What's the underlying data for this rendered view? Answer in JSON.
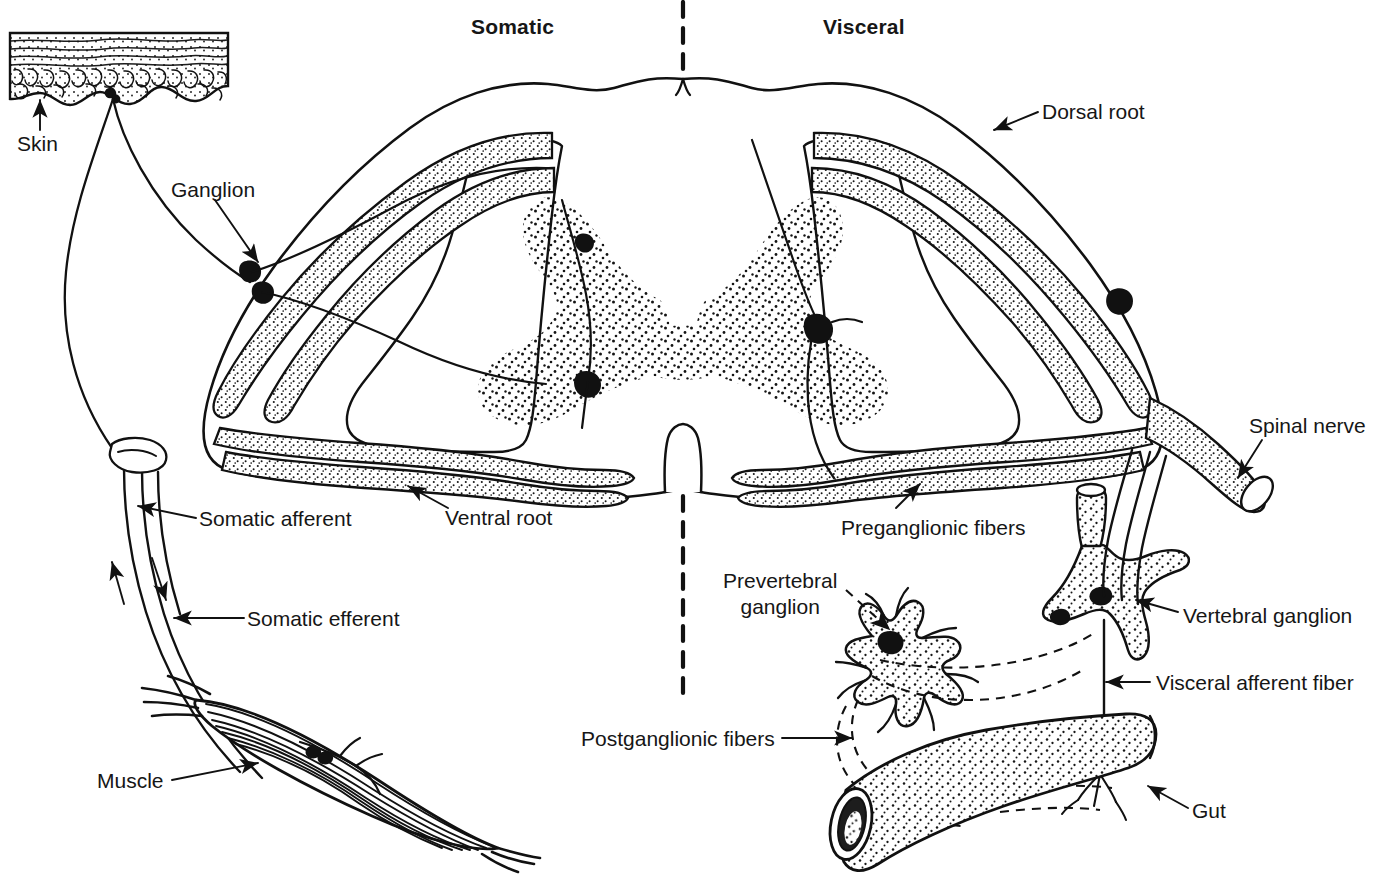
{
  "figure": {
    "type": "anatomical-diagram",
    "midline_divider": "dashed vertical line separating somatic (left) and visceral (right) halves"
  },
  "headers": {
    "left": "Somatic",
    "right": "Visceral"
  },
  "labels": {
    "skin": "Skin",
    "ganglion": "Ganglion",
    "somatic_afferent": "Somatic afferent",
    "somatic_efferent": "Somatic efferent",
    "ventral_root": "Ventral root",
    "muscle": "Muscle",
    "dorsal_root": "Dorsal root",
    "spinal_nerve": "Spinal nerve",
    "preganglionic_fibers": "Preganglionic fibers",
    "prevertebral_ganglion_line1": "Prevertebral",
    "prevertebral_ganglion_line2": "ganglion",
    "vertebral_ganglion": "Vertebral ganglion",
    "visceral_afferent_fiber": "Visceral afferent fiber",
    "postganglionic_fibers": "Postganglionic fibers",
    "gut": "Gut"
  },
  "structures": {
    "spinal_cord": "butterfly gray matter with surrounding white matter",
    "gray_matter": "stippled butterfly-shaped central region",
    "dorsal_root_ganglion_cells": 2,
    "skin_patch": "stippled epidermis block with wavy dermal border",
    "muscle": "fusiform striated skeletal muscle belly",
    "gut": "stippled cylindrical tube with open lumen",
    "prevertebral_ganglion": "star-shaped stippled ganglion with radiating processes",
    "vertebral_ganglion": "stippled sympathetic chain ganglion"
  },
  "colors": {
    "ink": "#111111",
    "paper": "#ffffff",
    "stipple": "#1a1a1a"
  }
}
